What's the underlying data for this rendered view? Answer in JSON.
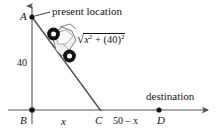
{
  "figure": {
    "type": "geometry-diagram",
    "background_color": "#ffffff",
    "ink_color": "#141414",
    "axis_color": "#555555",
    "labels": {
      "point_a": "A",
      "point_b": "B",
      "point_c": "C",
      "point_d": "D",
      "vertical_leg": "40",
      "segment_bc": "x",
      "segment_cd": "50 – x",
      "present_location": "present location",
      "destination": "destination"
    },
    "expression": {
      "radical_sign": "√",
      "term1_base": "x",
      "term1_exponent": "2",
      "plus": "+",
      "term2_base": "(40)",
      "term2_exponent": "2",
      "full_text": "√(x² + (40)²)"
    },
    "icons": {
      "vehicle": "motorcycle-icon",
      "leader_line": "leader-line-icon",
      "pointer_arrow": "pointer-arrow-icon",
      "axis_arrow_vertical": "axis-arrow-up-icon",
      "axis_arrow_horizontal": "axis-arrow-right-icon"
    },
    "geometry": {
      "point_a": [
        32,
        17
      ],
      "point_b": [
        32,
        110
      ],
      "point_c": [
        100,
        110
      ],
      "point_d": [
        159,
        110
      ],
      "hypotenuse": "A to C",
      "vertical_leg_length": "40",
      "horizontal_leg_label": "x",
      "remaining_leg_label": "50 – x"
    }
  }
}
